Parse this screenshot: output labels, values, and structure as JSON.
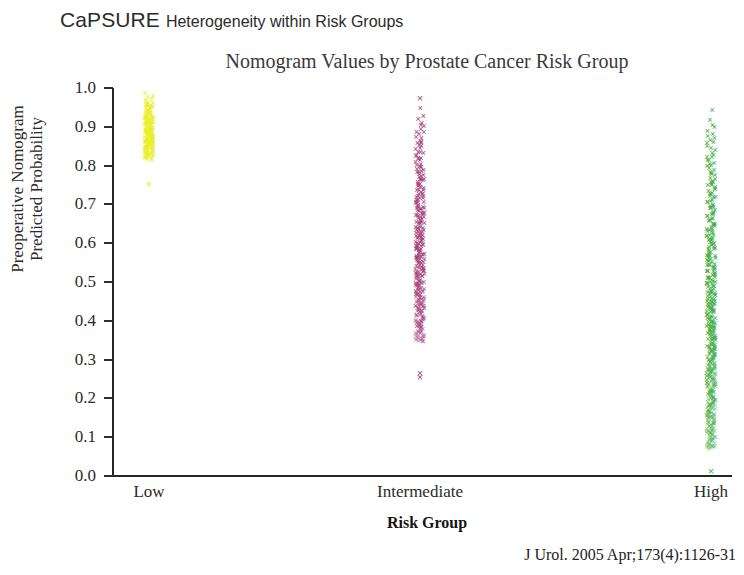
{
  "header": {
    "brand": "CaPSURE",
    "subtitle": "Heterogeneity within Risk Groups"
  },
  "citation": "J Urol. 2005 Apr;173(4):1126-31",
  "chart_data": {
    "type": "scatter",
    "title": "Nomogram Values by Prostate Cancer Risk Group",
    "xlabel": "Risk Group",
    "ylabel": "Preoperative Nomogram Predicted Probability",
    "ylabel_line1": "Preoperative Nomogram",
    "ylabel_line2": "Predicted Probability",
    "categories": [
      "Low",
      "Intermediate",
      "High"
    ],
    "ylim": [
      0.0,
      1.0
    ],
    "ytick_labels": [
      "1.0",
      "0.9",
      "0.8",
      "0.7",
      "0.6",
      "0.5",
      "0.4",
      "0.3",
      "0.2",
      "0.1",
      "0.0"
    ],
    "ytick_values": [
      1.0,
      0.9,
      0.8,
      0.7,
      0.6,
      0.5,
      0.4,
      0.3,
      0.2,
      0.1,
      0.0
    ],
    "grid": false,
    "legend": "none",
    "marker": "x",
    "series": [
      {
        "name": "Low",
        "color": "#eaf024",
        "x_category": "Low",
        "range": [
          0.75,
          0.985
        ],
        "dense_range": [
          0.815,
          0.985
        ],
        "outliers": [
          0.752
        ],
        "n_points": 180,
        "description": "Dense yellow band of nomogram values concentrated between 0.82 and 0.98, with a single point near 0.75."
      },
      {
        "name": "Intermediate",
        "color": "#a8417e",
        "x_category": "Intermediate",
        "range": [
          0.255,
          0.975
        ],
        "dense_range": [
          0.345,
          0.945
        ],
        "outliers": [
          0.975,
          0.265,
          0.255
        ],
        "n_points": 320,
        "description": "Dense magenta band spanning roughly 0.35 to 0.95, thinning below 0.55, with isolated points at 0.975, 0.265 and 0.255."
      },
      {
        "name": "High",
        "color": "#3fae44",
        "x_category": "High",
        "range": [
          0.01,
          0.945
        ],
        "dense_range": [
          0.07,
          0.94
        ],
        "outliers": [
          0.012
        ],
        "n_points": 420,
        "description": "Dense green band spanning nearly the full axis from about 0.07 to 0.94, with a single point at 0.01 on the baseline."
      }
    ]
  }
}
